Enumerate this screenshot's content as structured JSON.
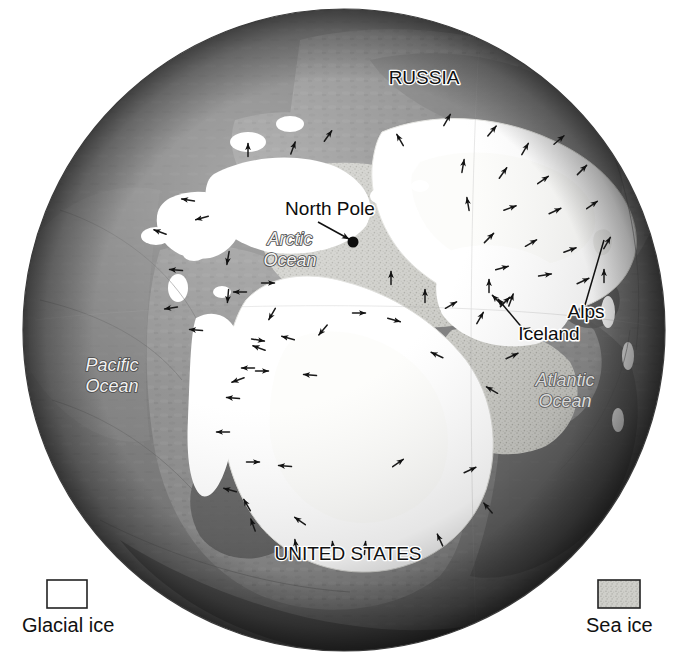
{
  "figure": {
    "kind": "ice-age-globe-map",
    "projection": "north-polar-orthographic",
    "background_color": "#ffffff",
    "globe": {
      "center_x": 344,
      "center_y": 330,
      "radius": 321
    }
  },
  "palette": {
    "ocean": "#7b7b7b",
    "ocean_dark": "#4f4f4f",
    "ocean_deep": "#3a3a3a",
    "land": "#8e8e8e",
    "land_dark": "#6a6a6a",
    "glacial_ice": "#ffffff",
    "glacial_ice_shadow": "#e8e8e6",
    "sea_ice": "#c9c9c4",
    "sea_ice_speckle": "#b3b3ad",
    "label_text": "#111111",
    "label_halo": "#ffffff",
    "arrow": "#1a1a1a"
  },
  "map_labels": [
    {
      "id": "russia",
      "text": "RUSSIA",
      "style": "country",
      "x": 424,
      "y": 84,
      "anchor": "middle"
    },
    {
      "id": "united-states",
      "text": "UNITED STATES",
      "style": "country",
      "x": 348,
      "y": 560,
      "anchor": "middle"
    },
    {
      "id": "north-pole",
      "text": "North Pole",
      "style": "point",
      "x": 330,
      "y": 215,
      "anchor": "middle"
    },
    {
      "id": "alps",
      "text": "Alps",
      "style": "point",
      "x": 586,
      "y": 318,
      "anchor": "middle"
    },
    {
      "id": "iceland",
      "text": "Iceland",
      "style": "point",
      "x": 549,
      "y": 340,
      "anchor": "middle"
    },
    {
      "id": "arctic-ocean",
      "text": "Arctic",
      "text2": "Ocean",
      "style": "ocean",
      "x": 290,
      "y": 245,
      "anchor": "middle"
    },
    {
      "id": "pacific-ocean",
      "text": "Pacific",
      "text2": "Ocean",
      "style": "ocean",
      "x": 112,
      "y": 371,
      "anchor": "middle"
    },
    {
      "id": "atlantic-ocean",
      "text": "Atlantic",
      "text2": "Ocean",
      "style": "ocean-dark",
      "x": 565,
      "y": 386,
      "anchor": "middle"
    }
  ],
  "annotations": {
    "north_pole_marker": {
      "x": 353,
      "y": 242,
      "radius": 5.5
    },
    "north_pole_leader": {
      "x1": 318,
      "y1": 222,
      "x2": 349,
      "y2": 239
    },
    "alps_leader": {
      "x1": 585,
      "y1": 305,
      "x2": 604,
      "y2": 240
    },
    "iceland_leader": {
      "x1": 524,
      "y1": 330,
      "x2": 498,
      "y2": 299
    }
  },
  "legend": {
    "title": "",
    "items": [
      {
        "id": "glacial-ice",
        "label": "Glacial ice",
        "swatch": "glacial",
        "fill": "#ffffff",
        "swatch_x": 47,
        "swatch_y": 580,
        "swatch_w": 40,
        "swatch_h": 28,
        "label_x": 22,
        "label_y": 632
      },
      {
        "id": "sea-ice",
        "label": "Sea ice",
        "swatch": "sea",
        "fill": "#c9c9c4",
        "swatch_x": 598,
        "swatch_y": 580,
        "swatch_w": 42,
        "swatch_h": 28,
        "label_x": 586,
        "label_y": 632
      }
    ]
  },
  "ice_flow_arrows": [
    {
      "x": 248,
      "y": 150,
      "dir": -90
    },
    {
      "x": 293,
      "y": 148,
      "dir": -70
    },
    {
      "x": 328,
      "y": 136,
      "dir": -55
    },
    {
      "x": 188,
      "y": 200,
      "dir": 190
    },
    {
      "x": 160,
      "y": 232,
      "dir": 200
    },
    {
      "x": 202,
      "y": 218,
      "dir": 165
    },
    {
      "x": 176,
      "y": 270,
      "dir": 185
    },
    {
      "x": 228,
      "y": 258,
      "dir": 100
    },
    {
      "x": 228,
      "y": 296,
      "dir": 95
    },
    {
      "x": 171,
      "y": 308,
      "dir": 172
    },
    {
      "x": 196,
      "y": 330,
      "dir": 185
    },
    {
      "x": 400,
      "y": 140,
      "dir": -120
    },
    {
      "x": 447,
      "y": 120,
      "dir": -60
    },
    {
      "x": 492,
      "y": 131,
      "dir": -50
    },
    {
      "x": 525,
      "y": 149,
      "dir": -60
    },
    {
      "x": 559,
      "y": 140,
      "dir": -40
    },
    {
      "x": 463,
      "y": 166,
      "dir": -80
    },
    {
      "x": 503,
      "y": 173,
      "dir": -55
    },
    {
      "x": 543,
      "y": 180,
      "dir": -35
    },
    {
      "x": 582,
      "y": 170,
      "dir": -45
    },
    {
      "x": 468,
      "y": 204,
      "dir": -100
    },
    {
      "x": 510,
      "y": 208,
      "dir": -20
    },
    {
      "x": 555,
      "y": 211,
      "dir": -25
    },
    {
      "x": 592,
      "y": 205,
      "dir": -35
    },
    {
      "x": 489,
      "y": 238,
      "dir": -45
    },
    {
      "x": 531,
      "y": 243,
      "dir": -30
    },
    {
      "x": 570,
      "y": 250,
      "dir": -20
    },
    {
      "x": 607,
      "y": 243,
      "dir": -60
    },
    {
      "x": 604,
      "y": 276,
      "dir": -90
    },
    {
      "x": 502,
      "y": 268,
      "dir": -15
    },
    {
      "x": 545,
      "y": 275,
      "dir": -10
    },
    {
      "x": 583,
      "y": 281,
      "dir": -25
    },
    {
      "x": 391,
      "y": 278,
      "dir": -90
    },
    {
      "x": 425,
      "y": 296,
      "dir": -90
    },
    {
      "x": 511,
      "y": 300,
      "dir": -70
    },
    {
      "x": 489,
      "y": 286,
      "dir": -90
    },
    {
      "x": 497,
      "y": 300,
      "dir": -135
    },
    {
      "x": 505,
      "y": 302,
      "dir": -45
    },
    {
      "x": 451,
      "y": 305,
      "dir": -30
    },
    {
      "x": 480,
      "y": 318,
      "dir": -60
    },
    {
      "x": 359,
      "y": 313,
      "dir": 0
    },
    {
      "x": 394,
      "y": 320,
      "dir": 15
    },
    {
      "x": 323,
      "y": 330,
      "dir": 130
    },
    {
      "x": 288,
      "y": 338,
      "dir": 195
    },
    {
      "x": 259,
      "y": 348,
      "dir": 200
    },
    {
      "x": 272,
      "y": 314,
      "dir": 120
    },
    {
      "x": 268,
      "y": 283,
      "dir": 0
    },
    {
      "x": 240,
      "y": 292,
      "dir": 180
    },
    {
      "x": 258,
      "y": 340,
      "dir": 10
    },
    {
      "x": 248,
      "y": 368,
      "dir": 180
    },
    {
      "x": 238,
      "y": 380,
      "dir": 160
    },
    {
      "x": 233,
      "y": 398,
      "dir": 185
    },
    {
      "x": 262,
      "y": 371,
      "dir": 0
    },
    {
      "x": 310,
      "y": 375,
      "dir": 185
    },
    {
      "x": 223,
      "y": 432,
      "dir": 180
    },
    {
      "x": 253,
      "y": 462,
      "dir": 0
    },
    {
      "x": 285,
      "y": 466,
      "dir": 185
    },
    {
      "x": 230,
      "y": 490,
      "dir": 195
    },
    {
      "x": 247,
      "y": 505,
      "dir": 240
    },
    {
      "x": 253,
      "y": 525,
      "dir": 250
    },
    {
      "x": 300,
      "y": 521,
      "dir": 215
    },
    {
      "x": 296,
      "y": 546,
      "dir": 260
    },
    {
      "x": 333,
      "y": 548,
      "dir": 265
    },
    {
      "x": 365,
      "y": 548,
      "dir": 275
    },
    {
      "x": 512,
      "y": 356,
      "dir": -25
    },
    {
      "x": 492,
      "y": 390,
      "dir": 210
    },
    {
      "x": 398,
      "y": 463,
      "dir": -35
    },
    {
      "x": 470,
      "y": 470,
      "dir": -25
    },
    {
      "x": 488,
      "y": 508,
      "dir": 230
    },
    {
      "x": 440,
      "y": 540,
      "dir": 245
    },
    {
      "x": 530,
      "y": 330,
      "dir": 195
    },
    {
      "x": 437,
      "y": 355,
      "dir": 205
    }
  ]
}
